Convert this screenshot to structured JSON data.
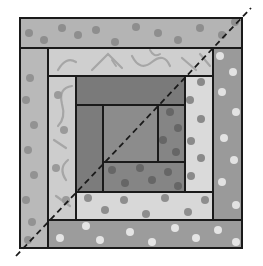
{
  "diagram": {
    "title": "Log cabin quilt block with diagonal fold line",
    "width": 263,
    "height": 266,
    "outline_color": "#1a1a1a",
    "background": "#ffffff",
    "diagonal": {
      "x1": 16,
      "y1": 256,
      "x2": 251,
      "y2": 8,
      "color": "#1a1a1a",
      "dash": "6,4",
      "label": "diagonal-cut-line"
    },
    "pieces": [
      {
        "id": "ring3-top-strip",
        "x": 20,
        "y": 18,
        "w": 222,
        "h": 30,
        "fill": "#b4b4b4",
        "dot": "#8e8e8e",
        "pattern": "dots"
      },
      {
        "id": "ring3-left-strip",
        "x": 20,
        "y": 48,
        "w": 28,
        "h": 200,
        "fill": "#b9b9b9",
        "dot": "#929292",
        "pattern": "dots"
      },
      {
        "id": "ring3-right-strip",
        "x": 213,
        "y": 48,
        "w": 29,
        "h": 172,
        "fill": "#9a9a9a",
        "dot": "#e2e2e2",
        "pattern": "dots"
      },
      {
        "id": "ring3-bottom-strip",
        "x": 48,
        "y": 220,
        "w": 194,
        "h": 28,
        "fill": "#9c9c9c",
        "dot": "#e4e4e4",
        "pattern": "dots"
      },
      {
        "id": "ring2-top-strip",
        "x": 48,
        "y": 48,
        "w": 165,
        "h": 28,
        "fill": "#cfcfcf",
        "dot": "#9a9a9a",
        "pattern": "swirl"
      },
      {
        "id": "ring2-left-strip",
        "x": 48,
        "y": 76,
        "w": 28,
        "h": 144,
        "fill": "#cdcdcd",
        "dot": "#9a9a9a",
        "pattern": "swirl"
      },
      {
        "id": "ring2-right-strip",
        "x": 185,
        "y": 76,
        "w": 28,
        "h": 116,
        "fill": "#dadada",
        "dot": "#8a8a8a",
        "pattern": "dots"
      },
      {
        "id": "ring2-bottom-strip",
        "x": 76,
        "y": 192,
        "w": 137,
        "h": 28,
        "fill": "#d8d8d8",
        "dot": "#8e8e8e",
        "pattern": "dots"
      },
      {
        "id": "ring1-top-strip",
        "x": 76,
        "y": 76,
        "w": 109,
        "h": 29,
        "fill": "#7a7a7a",
        "dot": "#6c6c6c",
        "pattern": "plain"
      },
      {
        "id": "ring1-left-strip",
        "x": 76,
        "y": 105,
        "w": 27,
        "h": 87,
        "fill": "#7c7c7c",
        "dot": "#6e6e6e",
        "pattern": "plain"
      },
      {
        "id": "ring1-right-strip",
        "x": 158,
        "y": 105,
        "w": 27,
        "h": 57,
        "fill": "#858585",
        "dot": "#666666",
        "pattern": "dots"
      },
      {
        "id": "ring1-bottom-strip",
        "x": 103,
        "y": 162,
        "w": 82,
        "h": 30,
        "fill": "#858585",
        "dot": "#666666",
        "pattern": "dots"
      },
      {
        "id": "center-square",
        "x": 103,
        "y": 105,
        "w": 55,
        "h": 57,
        "fill": "#8c8c8c",
        "dot": "#7c7c7c",
        "pattern": "plain"
      }
    ],
    "dots": [
      {
        "piece": 0,
        "pts": [
          [
            29,
            33
          ],
          [
            44,
            40
          ],
          [
            62,
            28
          ],
          [
            78,
            35
          ],
          [
            96,
            30
          ],
          [
            115,
            42
          ],
          [
            136,
            27
          ],
          [
            158,
            33
          ],
          [
            178,
            40
          ],
          [
            200,
            28
          ],
          [
            222,
            35
          ],
          [
            235,
            22
          ]
        ]
      },
      {
        "piece": 1,
        "pts": [
          [
            30,
            78
          ],
          [
            26,
            100
          ],
          [
            34,
            125
          ],
          [
            28,
            150
          ],
          [
            34,
            175
          ],
          [
            26,
            200
          ],
          [
            32,
            222
          ],
          [
            28,
            240
          ]
        ]
      },
      {
        "piece": 2,
        "pts": [
          [
            220,
            56
          ],
          [
            233,
            72
          ],
          [
            222,
            92
          ],
          [
            236,
            112
          ],
          [
            224,
            138
          ],
          [
            234,
            160
          ],
          [
            222,
            182
          ],
          [
            236,
            205
          ]
        ]
      },
      {
        "piece": 3,
        "pts": [
          [
            60,
            238
          ],
          [
            86,
            226
          ],
          [
            100,
            240
          ],
          [
            130,
            232
          ],
          [
            152,
            242
          ],
          [
            175,
            228
          ],
          [
            196,
            238
          ],
          [
            218,
            230
          ],
          [
            236,
            242
          ]
        ]
      },
      {
        "piece": 5,
        "pts": [
          [
            58,
            95
          ],
          [
            64,
            130
          ],
          [
            56,
            168
          ],
          [
            66,
            200
          ]
        ]
      },
      {
        "piece": 6,
        "pts": [
          [
            201,
            82
          ],
          [
            190,
            100
          ],
          [
            201,
            119
          ],
          [
            191,
            141
          ],
          [
            201,
            158
          ],
          [
            191,
            176
          ]
        ]
      },
      {
        "piece": 7,
        "pts": [
          [
            88,
            198
          ],
          [
            105,
            210
          ],
          [
            124,
            200
          ],
          [
            146,
            214
          ],
          [
            165,
            198
          ],
          [
            188,
            212
          ],
          [
            205,
            200
          ]
        ]
      },
      {
        "piece": 10,
        "pts": [
          [
            170,
            112
          ],
          [
            178,
            128
          ],
          [
            163,
            140
          ],
          [
            176,
            152
          ]
        ]
      },
      {
        "piece": 11,
        "pts": [
          [
            112,
            170
          ],
          [
            125,
            183
          ],
          [
            140,
            168
          ],
          [
            152,
            180
          ],
          [
            168,
            172
          ],
          [
            178,
            186
          ]
        ]
      }
    ]
  }
}
